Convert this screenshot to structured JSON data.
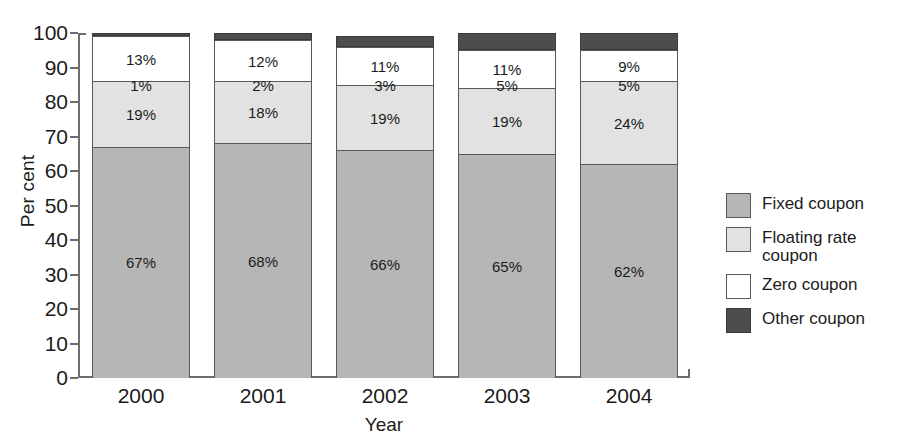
{
  "chart_data": {
    "type": "bar",
    "subtype": "stacked-percentage",
    "title": "",
    "xlabel": "Year",
    "ylabel": "Per cent",
    "ylim": [
      0,
      100
    ],
    "ytick_step": 10,
    "ytick_labels": [
      "100",
      "90",
      "80",
      "70",
      "60",
      "50",
      "40",
      "30",
      "20",
      "10",
      "0"
    ],
    "grid": false,
    "legend_position": "right",
    "categories": [
      "2000",
      "2001",
      "2002",
      "2003",
      "2004"
    ],
    "series": [
      {
        "name": "Fixed coupon",
        "color": "#b6b6b6",
        "values": [
          67,
          68,
          66,
          65,
          62
        ]
      },
      {
        "name": "Floating rate coupon",
        "color": "#e2e2e2",
        "values": [
          19,
          18,
          19,
          19,
          24
        ]
      },
      {
        "name": "Zero coupon",
        "color": "#ffffff",
        "values": [
          13,
          12,
          11,
          11,
          9
        ]
      },
      {
        "name": "Other coupon",
        "color": "#4d4d4d",
        "values": [
          1,
          2,
          3,
          5,
          5
        ]
      }
    ],
    "bar_labels": {
      "fixed": [
        "67%",
        "68%",
        "66%",
        "65%",
        "62%"
      ],
      "floating": [
        "19%",
        "18%",
        "19%",
        "19%",
        "24%"
      ],
      "zero": [
        "13%",
        "12%",
        "11%",
        "11%",
        "9%"
      ],
      "other": [
        "1%",
        "2%",
        "3%",
        "5%",
        "5%"
      ]
    }
  },
  "axis": {
    "y_title": "Per cent",
    "x_title": "Year"
  },
  "legend": {
    "items": [
      {
        "label": "Fixed coupon",
        "color": "#b6b6b6"
      },
      {
        "label": "Floating rate coupon",
        "color": "#e2e2e2"
      },
      {
        "label": "Zero coupon",
        "color": "#ffffff"
      },
      {
        "label": "Other coupon",
        "color": "#4d4d4d"
      }
    ]
  }
}
